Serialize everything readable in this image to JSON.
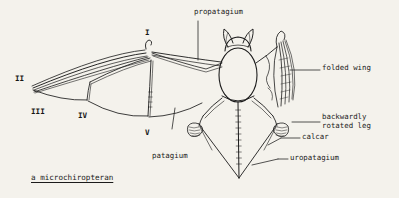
{
  "figure": {
    "caption": "a microchiropteran",
    "background_color": "#f4f2ec",
    "ink_color": "#1b1b1b",
    "width": 399,
    "height": 198
  },
  "labels": {
    "propatagium": "propatagium",
    "folded_wing": "folded wing",
    "backwardly_rotated_leg_line1": "backwardly",
    "backwardly_rotated_leg_line2": "rotated leg",
    "calcar": "calcar",
    "uropatagium": "uropatagium",
    "patagium": "patagium"
  },
  "digits": {
    "i": "I",
    "ii": "II",
    "iii": "III",
    "iv": "IV",
    "v": "V"
  }
}
